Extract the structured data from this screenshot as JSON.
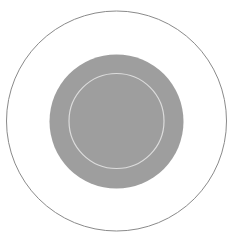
{
  "canvas": {
    "width": 230,
    "height": 244,
    "background": "#ffffff"
  },
  "diagram": {
    "shapes": [
      {
        "id": "outer-ring",
        "type": "circle",
        "cx": 116.5,
        "cy": 121,
        "r": 110,
        "fill": "none",
        "stroke": "#8a8a8a",
        "stroke_width": 1
      },
      {
        "id": "gray-disc",
        "type": "circle",
        "cx": 116.5,
        "cy": 121.5,
        "r": 67,
        "fill": "#9e9e9e",
        "stroke": "none",
        "stroke_width": 0
      },
      {
        "id": "inner-ring",
        "type": "circle",
        "cx": 116.5,
        "cy": 121,
        "r": 47.5,
        "fill": "none",
        "stroke": "#dcdcdc",
        "stroke_width": 1.2
      }
    ]
  }
}
